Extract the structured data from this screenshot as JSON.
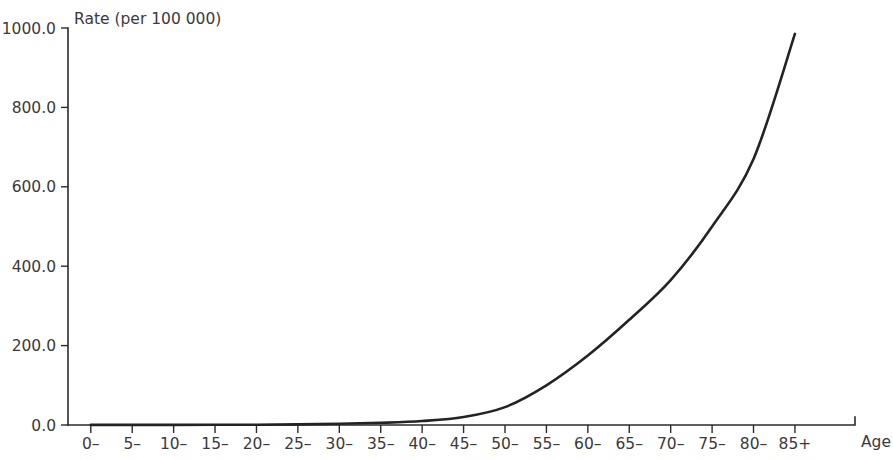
{
  "chart_data": {
    "type": "line",
    "title": "",
    "subtitle": "",
    "xlabel": "Age",
    "ylabel": "Rate (per 100 000)",
    "grid": false,
    "legend": null,
    "xlim": [
      0,
      18
    ],
    "ylim": [
      0.0,
      1000.0
    ],
    "y_ticks": [
      "0.0",
      "200.0",
      "400.0",
      "600.0",
      "800.0",
      "1000.0"
    ],
    "y_tick_values": [
      0.0,
      200.0,
      400.0,
      600.0,
      800.0,
      1000.0
    ],
    "categories": [
      "0–",
      "5–",
      "10–",
      "15–",
      "20–",
      "25–",
      "30–",
      "35–",
      "40–",
      "45–",
      "50–",
      "55–",
      "60–",
      "65–",
      "70–",
      "75–",
      "80–",
      "85+"
    ],
    "values": [
      0.3,
      0.2,
      0.3,
      0.5,
      0.8,
      1.5,
      3.0,
      5.5,
      10.0,
      20.0,
      45.0,
      100.0,
      175.0,
      265.0,
      365.0,
      500.0,
      670.0,
      985.0
    ],
    "series": [
      {
        "name": "Rate",
        "color": "#232323",
        "values": [
          0.3,
          0.2,
          0.3,
          0.5,
          0.8,
          1.5,
          3.0,
          5.5,
          10.0,
          20.0,
          45.0,
          100.0,
          175.0,
          265.0,
          365.0,
          500.0,
          670.0,
          985.0
        ]
      }
    ]
  },
  "axes": {
    "y_axis_title": "Rate (per 100 000)",
    "x_axis_title": "Age"
  },
  "colors": {
    "curve": "#232323",
    "axis": "#2b2b2b",
    "text": "#3a3a3a",
    "background": "#ffffff"
  }
}
